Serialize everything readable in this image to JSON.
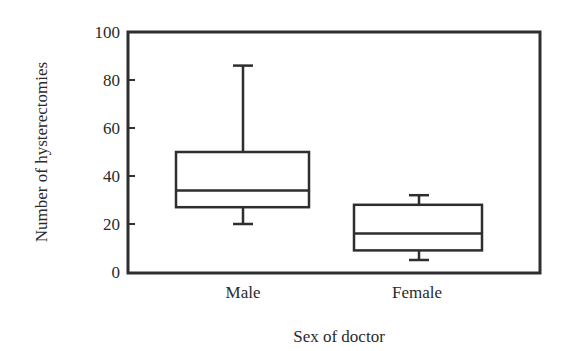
{
  "chart_data": {
    "type": "box",
    "title": "",
    "xlabel": "Sex of doctor",
    "ylabel": "Number of hysterectomies",
    "ylim": [
      0,
      100
    ],
    "yticks": [
      0,
      20,
      40,
      60,
      80,
      100
    ],
    "categories": [
      "Male",
      "Female"
    ],
    "series": [
      {
        "name": "Male",
        "whisker_low": 20,
        "q1": 27,
        "median": 34,
        "q3": 50,
        "whisker_high": 86
      },
      {
        "name": "Female",
        "whisker_low": 5,
        "q1": 9,
        "median": 16,
        "q3": 28,
        "whisker_high": 32
      }
    ],
    "grid": false,
    "legend": null
  },
  "colors": {
    "line": "#2e2e2e",
    "text": "#2a2a2a",
    "background": "#ffffff"
  }
}
